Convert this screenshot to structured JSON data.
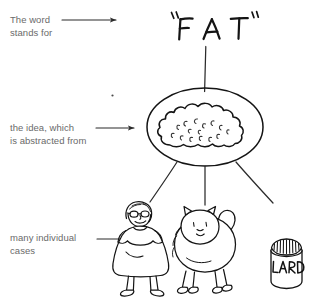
{
  "diagram": {
    "background_color": "#ffffff",
    "ink_color": "#1a1a1a",
    "label_color": "#6a6a6a"
  },
  "labels": {
    "word_line1": "The word",
    "word_line2": "stands for",
    "idea_line1": "the idea, which",
    "idea_line2": "is abstracted from",
    "cases_line1": "many individual",
    "cases_line2": "cases"
  },
  "symbol": {
    "open_quote": "“",
    "letter_f": "F",
    "letter_a": "A",
    "letter_t": "T",
    "close_quote": "”",
    "full_text": "“FAT”"
  },
  "concept": {
    "shape": "ellipse-with-cloud-blob",
    "description": "cloud blob inside oval"
  },
  "instances": [
    {
      "name": "fat-person-with-glasses",
      "label": ""
    },
    {
      "name": "fat-cat",
      "label": ""
    },
    {
      "name": "lard-can",
      "label": "LARD"
    }
  ],
  "connectors": {
    "word_to_idea": "vertical-line",
    "idea_to_cases": "three-diverging-lines",
    "arrow_count": 3
  }
}
